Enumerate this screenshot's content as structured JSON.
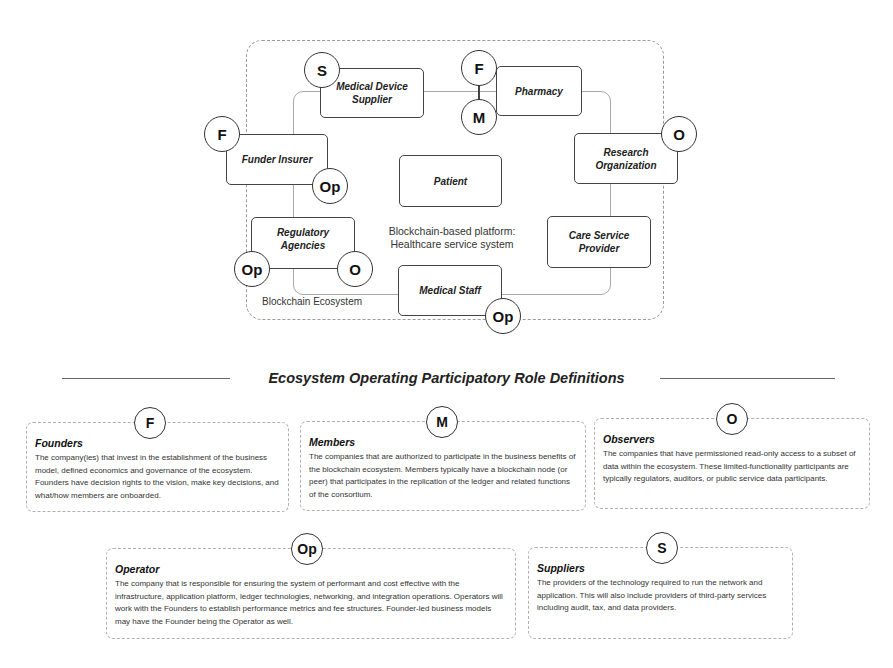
{
  "diagram": {
    "ecosystem_label": "Blockchain Ecosystem",
    "platform_label_line1": "Blockchain-based platform:",
    "platform_label_line2": "Healthcare service system",
    "nodes": {
      "medical_device_supplier": {
        "line1": "Medical Device",
        "line2": "Supplier",
        "badges": [
          "S"
        ]
      },
      "pharmacy": {
        "label": "Pharmacy",
        "badges": [
          "F",
          "M"
        ]
      },
      "funder_insurer": {
        "label": "Funder Insurer",
        "badges": [
          "F",
          "Op"
        ]
      },
      "research_organization": {
        "line1": "Research",
        "line2": "Organization",
        "badges": [
          "O"
        ]
      },
      "patient": {
        "label": "Patient",
        "badges": []
      },
      "regulatory_agencies": {
        "line1": "Regulatory",
        "line2": "Agencies",
        "badges": [
          "Op",
          "O"
        ]
      },
      "care_service_provider": {
        "line1": "Care Service",
        "line2": "Provider",
        "badges": []
      },
      "medical_staff": {
        "label": "Medical Staff",
        "badges": [
          "Op"
        ]
      }
    }
  },
  "section_title": "Ecosystem Operating Participatory Role Definitions",
  "roles": [
    {
      "badge": "F",
      "title": "Founders",
      "body": "The company(ies) that invest in the establishment of the business model, defined economics and governance of the ecosystem. Founders have decision rights to the vision, make key decisions, and what/how members are onboarded."
    },
    {
      "badge": "M",
      "title": "Members",
      "body": "The companies that are authorized to participate in the business benefits of the blockchain ecosystem. Members typically have a blockchain node (or peer) that participates in the replication of the ledger and related functions of the consortium."
    },
    {
      "badge": "O",
      "title": "Observers",
      "body": "The companies that have permissioned read-only access to a subset of data within the ecosystem. These limited-functionality participants are typically regulators, auditors, or public service data participants."
    },
    {
      "badge": "Op",
      "title": "Operator",
      "body": "The company that is responsible for ensuring the system of performant and cost effective with the infrastructure, application platform, ledger technologies, networking, and integration operations. Operators will work with the Founders to establish performance metrics and fee structures. Founder-led business models may have the Founder being the Operator as well."
    },
    {
      "badge": "S",
      "title": "Suppliers",
      "body": "The providers of the technology required to run the network and application. This will also include providers of third-party services including audit, tax, and data providers."
    }
  ]
}
